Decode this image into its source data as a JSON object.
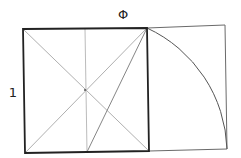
{
  "diagram": {
    "labels": {
      "top": "Φ",
      "left": "1"
    },
    "colors": {
      "stroke_main": "#222222",
      "stroke_thin": "#8a8a8a",
      "background": "#ffffff"
    },
    "elements": [
      {
        "name": "unit-square",
        "type": "square"
      },
      {
        "name": "square-diagonals",
        "type": "lines"
      },
      {
        "name": "square-midline",
        "type": "line"
      },
      {
        "name": "midpoint-to-corner-line",
        "type": "line"
      },
      {
        "name": "golden-arc",
        "type": "arc"
      },
      {
        "name": "extension-rectangle",
        "type": "rectangle"
      }
    ]
  }
}
